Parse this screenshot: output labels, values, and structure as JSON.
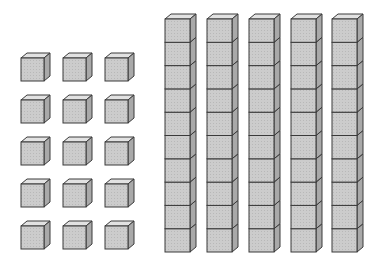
{
  "diagram": {
    "units": {
      "columns": 3,
      "rows": 5,
      "count": 15,
      "col_x": [
        21,
        63,
        105
      ],
      "row_y": [
        58,
        100,
        142,
        184,
        226
      ],
      "size": 23
    },
    "rods": {
      "count": 5,
      "cubes_per_rod": 10,
      "x": [
        165,
        207,
        249,
        291,
        332
      ],
      "top_y": 19,
      "unit": 23.3,
      "width": 25
    },
    "depth": 6,
    "colors": {
      "front": "#cfcfcf",
      "top": "#e2e2e2",
      "side": "#a9a9a9",
      "stroke": "#3a3a3a"
    }
  }
}
